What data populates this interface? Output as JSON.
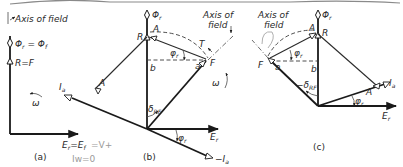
{
  "figure": {
    "panels": [
      {
        "id": "a",
        "caption": "(a)",
        "labels": {
          "axis_of_field": "Axis of field",
          "phi_eq": "Φr = Φf",
          "phi_main": "Φ",
          "phi_r_sub": "r",
          "phi_f_sub": "f",
          "r_eq_f": "R=F",
          "omega": "ω",
          "er_ef": "Er=Ef",
          "handwritten_v": "=V+",
          "handwritten_iw": "Iw=0"
        }
      },
      {
        "id": "b",
        "caption": "(b)",
        "labels": {
          "phi_r": "Φr",
          "R": "R",
          "A": "A",
          "phi_r_angle": "φr",
          "axis_of_field_1": "Axis of",
          "axis_of_field_2": "field",
          "T": "T",
          "F": "F",
          "a": "a",
          "b": "b",
          "delta_rf": "δRF",
          "omega": "ω",
          "Ia": "Ia",
          "A2": "A",
          "Er": "Er",
          "phi_r_angle2": "φr",
          "neg_Ia": "−Ia"
        }
      },
      {
        "id": "c",
        "caption": "(c)",
        "labels": {
          "axis_of_field_1": "Axis of",
          "axis_of_field_2": "field",
          "phi_r": "Φr",
          "A": "A",
          "R": "R",
          "phi_r_angle": "φr",
          "F": "F",
          "a": "a",
          "b": "b",
          "neg_delta_rf": "−δRF",
          "Ia": "Ia",
          "A2": "A",
          "phi_r_angle2": "φr",
          "Er": "Er"
        }
      }
    ]
  },
  "colors": {
    "ink": "#2a2a2a",
    "pencil": "#9a9a9a",
    "background": "#ffffff"
  }
}
